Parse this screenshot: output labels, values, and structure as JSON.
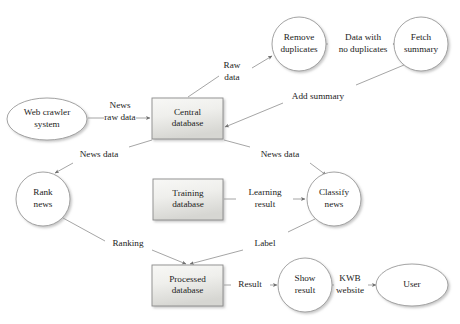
{
  "diagram": {
    "colors": {
      "box_fill_top": "#f6f6f4",
      "box_fill_bottom": "#d8d8d4",
      "box_stroke": "#8a8a8a",
      "circle_fill": "#ffffff",
      "circle_stroke": "#9a9a9a",
      "edge_stroke": "#8e8e8e",
      "text": "#1c1c1c",
      "background": "#ffffff"
    },
    "nodes": [
      {
        "id": "web-crawler-system",
        "shape": "ellipse",
        "cx": 47,
        "cy": 119,
        "rx": 40,
        "ry": 21,
        "lines": [
          "Web crawler",
          "system"
        ]
      },
      {
        "id": "central-database",
        "shape": "box",
        "x": 152,
        "y": 98,
        "w": 71,
        "h": 41,
        "lines": [
          "Central",
          "database"
        ]
      },
      {
        "id": "remove-duplicates",
        "shape": "circle",
        "cx": 299,
        "cy": 44,
        "r": 27,
        "lines": [
          "Remove",
          "duplicates"
        ]
      },
      {
        "id": "fetch-summary",
        "shape": "circle",
        "cx": 421,
        "cy": 44,
        "r": 27,
        "lines": [
          "Fetch",
          "summary"
        ]
      },
      {
        "id": "rank-news",
        "shape": "circle",
        "cx": 43,
        "cy": 199,
        "r": 27,
        "lines": [
          "Rank",
          "news"
        ]
      },
      {
        "id": "training-database",
        "shape": "box",
        "x": 153,
        "y": 179,
        "w": 70,
        "h": 41,
        "lines": [
          "Training",
          "database"
        ]
      },
      {
        "id": "classify-news",
        "shape": "circle",
        "cx": 334,
        "cy": 199,
        "r": 27,
        "lines": [
          "Classify",
          "news"
        ]
      },
      {
        "id": "processed-database",
        "shape": "box",
        "x": 152,
        "y": 265,
        "w": 71,
        "h": 41,
        "lines": [
          "Processed",
          "database"
        ]
      },
      {
        "id": "show-result",
        "shape": "circle",
        "cx": 305,
        "cy": 285,
        "r": 27,
        "lines": [
          "Show",
          "result"
        ]
      },
      {
        "id": "user",
        "shape": "ellipse",
        "cx": 412,
        "cy": 285,
        "rx": 36,
        "ry": 21,
        "lines": [
          "User"
        ]
      }
    ],
    "edges": [
      {
        "id": "crawler-to-central",
        "from": "web-crawler-system",
        "to": "central-database",
        "label_lines": [
          "News",
          "raw data"
        ],
        "label_x": 120,
        "label_y": 112,
        "path": "M 88 118 L 104 118 M 136 118 L 150 118",
        "arrow": true
      },
      {
        "id": "central-to-remove-duplicates",
        "from": "central-database",
        "to": "remove-duplicates",
        "label_lines": [
          "Raw",
          "data"
        ],
        "label_x": 232,
        "label_y": 72,
        "path": "M 188 97 L 219 76 M 252 68 L 272 56",
        "arrow": true
      },
      {
        "id": "remove-duplicates-to-fetch-summary",
        "from": "remove-duplicates",
        "to": "fetch-summary",
        "label_lines": [
          "Data with",
          "no duplicates"
        ],
        "label_x": 363,
        "label_y": 44,
        "path": "M 326 44 L 328 44 M 400 44 L 393 44",
        "arrow": true
      },
      {
        "id": "fetch-summary-to-central",
        "from": "fetch-summary",
        "to": "central-database",
        "label_lines": [
          "Add summary"
        ],
        "label_x": 318,
        "label_y": 97,
        "path": "M 404 65 L 356 85 M 283 103 L 225 127",
        "arrow": true
      },
      {
        "id": "central-to-rank-news",
        "from": "central-database",
        "to": "rank-news",
        "label_lines": [
          "News data"
        ],
        "label_x": 99,
        "label_y": 155,
        "path": "M 152 140 L 129 147 M 73 163 L 55 173",
        "arrow": true
      },
      {
        "id": "central-to-classify-news",
        "from": "central-database",
        "to": "classify-news",
        "label_lines": [
          "News data"
        ],
        "label_x": 280,
        "label_y": 155,
        "path": "M 224 140 L 250 147 M 310 163 L 326 175",
        "arrow": true
      },
      {
        "id": "training-to-classify-news",
        "from": "training-database",
        "to": "classify-news",
        "label_lines": [
          "Learning",
          "result"
        ],
        "label_x": 265,
        "label_y": 199,
        "path": "M 224 199 L 236 199 M 293 199 L 305 199",
        "arrow": true
      },
      {
        "id": "rank-news-to-processed",
        "from": "rank-news",
        "to": "processed-database",
        "label_lines": [
          "Ranking"
        ],
        "label_x": 128,
        "label_y": 244,
        "path": "M 63 218 L 105 241 M 152 250 L 186 264",
        "arrow": true
      },
      {
        "id": "classify-news-to-processed",
        "from": "classify-news",
        "to": "processed-database",
        "label_lines": [
          "Label"
        ],
        "label_x": 265,
        "label_y": 244,
        "path": "M 315 219 L 288 232 M 243 250 L 190 264",
        "arrow": true
      },
      {
        "id": "processed-to-show-result",
        "from": "processed-database",
        "to": "show-result",
        "label_lines": [
          "Result"
        ],
        "label_x": 250,
        "label_y": 285,
        "path": "M 224 285 L 231 285 M 270 285 L 277 285",
        "arrow": true
      },
      {
        "id": "show-result-to-user",
        "from": "show-result",
        "to": "user",
        "label_lines": [
          "KWB",
          "website"
        ],
        "label_x": 350,
        "label_y": 285,
        "path": "M 332 285 L 334 285 M 368 285 L 376 285",
        "arrow": true
      }
    ]
  }
}
